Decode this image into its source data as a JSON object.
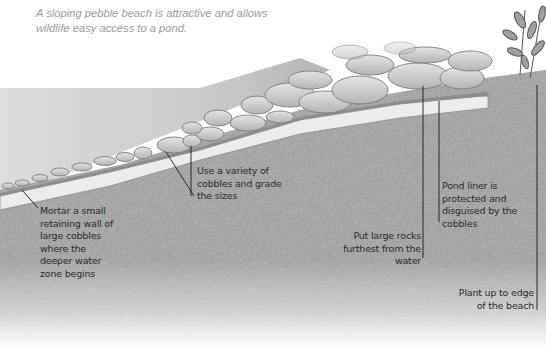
{
  "caption": {
    "line1": "A sloping pebble beach is attractive and allows",
    "line2": "wildlife easy access to a pond."
  },
  "labels": [
    {
      "id": "mortar-wall",
      "lines": [
        "Mortar a small",
        "retaining wall of",
        "large cobbles",
        "where the",
        "deeper water",
        "zone begins"
      ]
    },
    {
      "id": "variety",
      "lines": [
        "Use a variety of",
        "cobbles and grade",
        "the sizes"
      ]
    },
    {
      "id": "pond-liner",
      "lines": [
        "Pond liner is",
        "protected and",
        "disguised by the",
        "cobbles"
      ]
    },
    {
      "id": "large-rocks",
      "lines": [
        "Put large rocks",
        "furthest from the",
        "water"
      ]
    },
    {
      "id": "plant-edge",
      "lines": [
        "Plant up to edge",
        "of the beach"
      ]
    }
  ],
  "colors": {
    "soil": "#9c9c9c",
    "soil_dark": "#8a8a8a",
    "liner": "#e8e8e8",
    "water": "#c9c9c9",
    "cobble": "#cfcfcf",
    "cobble_edge": "#7a7a7a",
    "leader": "#1a1a1a",
    "caption": "#9a9a9a"
  }
}
